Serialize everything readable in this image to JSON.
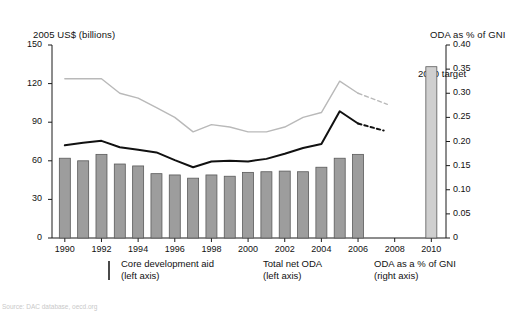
{
  "figure": {
    "left_axis_title": "2005 US$ (billions)",
    "right_axis_title": "ODA as % of GNI",
    "target_annotation": "2010 target",
    "source_note": "Source: DAC database, oecd.org",
    "top_cropped_text": ""
  },
  "legend": {
    "items": [
      {
        "label": "Core development aid",
        "sub": "(left axis)",
        "marker": "bar-swatch-icon",
        "color": "#9d9d9d"
      },
      {
        "label": "Total net ODA",
        "sub": "(left axis)",
        "marker": "line-swatch-icon",
        "color": "#111111"
      },
      {
        "label": "ODA as a % of GNI",
        "sub": "(right axis)",
        "marker": "line-swatch-icon",
        "color": "#b9b9b9"
      }
    ]
  },
  "chart_data": {
    "type": "bar",
    "title": "",
    "xlabel": "",
    "ylabel": "2005 US$ (billions)",
    "y2label": "ODA as % of GNI",
    "ylim": [
      0,
      150
    ],
    "y2lim": [
      0,
      0.4
    ],
    "yticks": [
      0,
      30,
      60,
      90,
      120,
      150
    ],
    "y2ticks": [
      "0",
      "0.05",
      "0.10",
      "0.15",
      "0.20",
      "0.25",
      "0.30",
      "0.35",
      "0.40"
    ],
    "xticks": [
      1990,
      1992,
      1994,
      1996,
      1998,
      2000,
      2002,
      2004,
      2006,
      2008,
      2010
    ],
    "x": [
      1990,
      1991,
      1992,
      1993,
      1994,
      1995,
      1996,
      1997,
      1998,
      1999,
      2000,
      2001,
      2002,
      2003,
      2004,
      2005,
      2006
    ],
    "grid": false,
    "legend_position": "bottom",
    "series": [
      {
        "name": "Core development aid",
        "type": "bar",
        "axis": "left",
        "color": "#9d9d9d",
        "values": [
          62,
          60,
          65,
          57.5,
          56,
          50,
          49,
          46.5,
          49,
          48,
          51,
          51.5,
          52,
          51.5,
          55,
          62,
          65
        ]
      },
      {
        "name": "Total net ODA",
        "type": "line",
        "axis": "left",
        "color": "#111111",
        "values": [
          72,
          74,
          75.5,
          70.5,
          68.5,
          66.5,
          60.5,
          55,
          59.5,
          60,
          59.5,
          61.5,
          65.5,
          70,
          73,
          98.5,
          89
        ],
        "projection": {
          "x": [
            2006,
            2007.4
          ],
          "values": [
            89,
            83.5
          ],
          "style": "dashed"
        }
      },
      {
        "name": "ODA as a % of GNI",
        "type": "line",
        "axis": "right",
        "color": "#b9b9b9",
        "values": [
          0.33,
          0.33,
          0.33,
          0.3,
          0.29,
          0.27,
          0.25,
          0.22,
          0.235,
          0.23,
          0.22,
          0.22,
          0.23,
          0.25,
          0.26,
          0.325,
          0.3
        ],
        "projection": {
          "x": [
            2006,
            2007.6
          ],
          "values": [
            0.3,
            0.277
          ],
          "style": "dashed"
        }
      },
      {
        "name": "2010 target",
        "type": "bar",
        "axis": "right",
        "color": "#cfcfcf",
        "x": [
          2010
        ],
        "values": [
          0.355
        ]
      }
    ]
  }
}
